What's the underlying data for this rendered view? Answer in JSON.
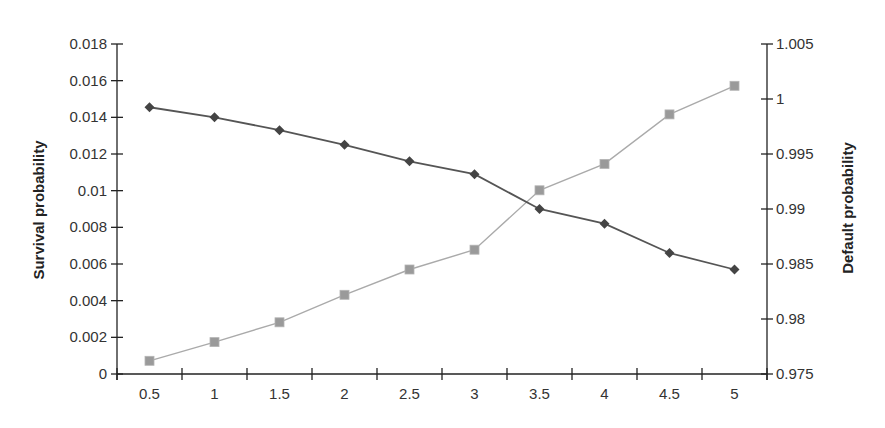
{
  "chart_data": {
    "type": "line",
    "title": "",
    "xlabel": "",
    "ylabel": "Survival probability",
    "y2label": "Default probability",
    "categories": [
      "0.5",
      "1",
      "1.5",
      "2",
      "2.5",
      "3",
      "3.5",
      "4",
      "4.5",
      "5"
    ],
    "ylim": [
      0,
      0.018
    ],
    "yticks": [
      "0",
      "0.002",
      "0.004",
      "0.006",
      "0.008",
      "0.01",
      "0.012",
      "0.014",
      "0.016",
      "0.018"
    ],
    "y2lim": [
      0.975,
      1.005
    ],
    "y2ticks": [
      "0.975",
      "0.98",
      "0.985",
      "0.99",
      "0.995",
      "1",
      "1.005"
    ],
    "grid": false,
    "legend": "none",
    "series": [
      {
        "name": "Survival probability",
        "axis": "left",
        "marker": "diamond",
        "color": "#444444",
        "values": [
          0.01455,
          0.014,
          0.0133,
          0.0125,
          0.0116,
          0.0109,
          0.009,
          0.0082,
          0.0066,
          0.0057
        ]
      },
      {
        "name": "Default probability",
        "axis": "right",
        "marker": "square",
        "color": "#9a9a9a",
        "values": [
          0.9762,
          0.9779,
          0.9797,
          0.9822,
          0.9845,
          0.9863,
          0.9917,
          0.9941,
          0.9986,
          1.0012
        ]
      }
    ]
  }
}
